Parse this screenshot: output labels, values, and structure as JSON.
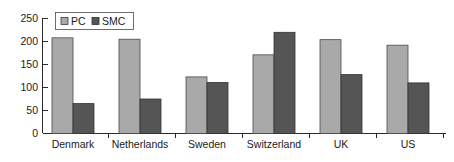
{
  "chart_data": {
    "type": "bar",
    "title": "",
    "subtitle": "",
    "xlabel": "",
    "ylabel": "",
    "categories": [
      "Denmark",
      "Netherlands",
      "Sweden",
      "Switzerland",
      "UK",
      "US"
    ],
    "series": [
      {
        "name": "PC",
        "values": [
          208,
          205,
          123,
          171,
          204,
          192
        ],
        "color": "#a9a9a9"
      },
      {
        "name": "SMC",
        "values": [
          65,
          75,
          111,
          220,
          128,
          110
        ],
        "color": "#555555"
      }
    ],
    "ylim": [
      0,
      250
    ],
    "ytick_values": [
      0,
      50,
      100,
      150,
      200,
      250
    ],
    "ytick_labels": [
      "0",
      "50",
      "100",
      "150",
      "200",
      "250"
    ],
    "grid": false,
    "legend": {
      "position": "top-left",
      "entries": [
        {
          "label": "PC",
          "marker": "square-light-gray"
        },
        {
          "label": "SMC",
          "marker": "square-dark-gray"
        }
      ]
    },
    "annotations": []
  }
}
